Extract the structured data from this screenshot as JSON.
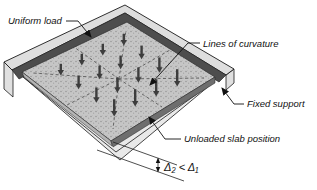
{
  "figure": {
    "labels": {
      "uniform_load": "Uniform load",
      "lines_of_curvature": "Lines of curvature",
      "fixed_support": "Fixed support",
      "unloaded_slab_position": "Unloaded slab position",
      "deflection_comparison": "Δ₂ < Δ₁"
    },
    "colors": {
      "background": "#ffffff",
      "slab_surface": "#c6c6c6",
      "support_dark_face": "#4d4d4d",
      "support_light_band": "#dedede",
      "slab_edge_left": "#b5b5b5",
      "slab_edge_right": "#6e6e6e",
      "unloaded_slab": "#e9e9e9",
      "load_arrow": "#3d3d3d",
      "curvature_line": "#5a5a5a",
      "outline": "#1a1a1a"
    },
    "icons": {
      "load_arrow": "down-arrow",
      "leader_arrowhead": "solid-triangle-arrowhead",
      "deflection_dimension": "double-headed-vertical-arrow"
    }
  }
}
